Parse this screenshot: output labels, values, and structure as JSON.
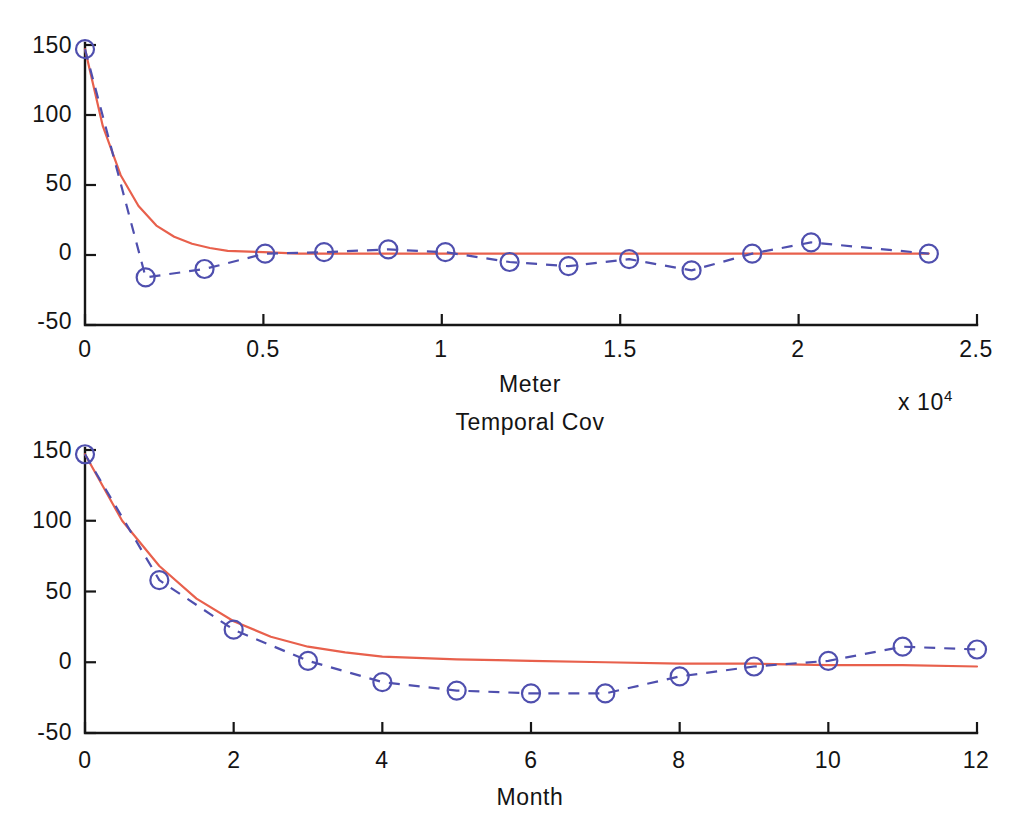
{
  "figure": {
    "background_color": "#ffffff",
    "model_color": "#e8604c",
    "empirical_color": "#4f4fae",
    "axis_color": "#161616"
  },
  "panels": {
    "spatial": {
      "x_axis_label": "Meter",
      "x_exponent_label": "x 10",
      "x_exponent_power": "4",
      "y_ticks": [
        "150",
        "100",
        "50",
        "0",
        "-50"
      ],
      "x_ticks": [
        "0",
        "0.5",
        "1",
        "1.5",
        "2",
        "2.5"
      ]
    },
    "temporal": {
      "title": "Temporal Cov",
      "x_axis_label": "Month",
      "y_ticks": [
        "150",
        "100",
        "50",
        "0",
        "-50"
      ],
      "x_ticks": [
        "0",
        "2",
        "4",
        "6",
        "8",
        "10",
        "12"
      ]
    }
  },
  "chart_data": [
    {
      "type": "line",
      "title": "",
      "xlabel": "Meter",
      "ylabel": "",
      "xlim": [
        0,
        25000
      ],
      "ylim": [
        -50,
        150
      ],
      "x_tick_values": [
        0,
        5000,
        10000,
        15000,
        20000,
        25000
      ],
      "x_tick_labels": [
        "0",
        "0.5",
        "1",
        "1.5",
        "2",
        "2.5"
      ],
      "x_tick_multiplier": "x 10^4",
      "y_tick_values": [
        -50,
        0,
        50,
        100,
        150
      ],
      "y_tick_labels": [
        "-50",
        "0",
        "50",
        "100",
        "150"
      ],
      "grid": false,
      "legend": "none",
      "series": [
        {
          "name": "Empirical spatial covariance",
          "style": "dashed-with-circle-markers",
          "color": "#4f4fae",
          "x": [
            0,
            1700,
            3350,
            5050,
            6700,
            8500,
            10100,
            11900,
            13550,
            15250,
            17000,
            18700,
            20350,
            23650
          ],
          "y": [
            147,
            -16,
            -10,
            1,
            2,
            4,
            2,
            -5,
            -8,
            -3,
            -11,
            1,
            9,
            1
          ]
        },
        {
          "name": "Fitted exponential model",
          "style": "solid",
          "color": "#e8604c",
          "x": [
            0,
            500,
            1000,
            1500,
            2000,
            2500,
            3000,
            3500,
            4000,
            5000,
            6000,
            8000,
            10000,
            14000,
            18000,
            23650
          ],
          "y": [
            147,
            92,
            57,
            35,
            21,
            13,
            8,
            5,
            3,
            2,
            1,
            1,
            1,
            1,
            1,
            1
          ]
        }
      ]
    },
    {
      "type": "line",
      "title": "Temporal Cov",
      "xlabel": "Month",
      "ylabel": "",
      "xlim": [
        0,
        12
      ],
      "ylim": [
        -50,
        150
      ],
      "x_tick_values": [
        0,
        2,
        4,
        6,
        8,
        10,
        12
      ],
      "x_tick_labels": [
        "0",
        "2",
        "4",
        "6",
        "8",
        "10",
        "12"
      ],
      "y_tick_values": [
        -50,
        0,
        50,
        100,
        150
      ],
      "y_tick_labels": [
        "-50",
        "0",
        "50",
        "100",
        "150"
      ],
      "grid": false,
      "legend": "none",
      "series": [
        {
          "name": "Empirical temporal covariance",
          "style": "dashed-with-circle-markers",
          "color": "#4f4fae",
          "x": [
            0,
            1,
            2,
            3,
            4,
            5,
            6,
            7,
            8,
            9,
            10,
            11,
            12
          ],
          "y": [
            147,
            58,
            23,
            1,
            -14,
            -20,
            -22,
            -22,
            -10,
            -3,
            1,
            11,
            9
          ]
        },
        {
          "name": "Fitted exponential model",
          "style": "solid",
          "color": "#e8604c",
          "x": [
            0,
            0.5,
            1,
            1.5,
            2,
            2.5,
            3,
            3.5,
            4,
            5,
            6,
            7,
            8,
            9,
            10,
            11,
            12
          ],
          "y": [
            147,
            100,
            68,
            45,
            29,
            18,
            11,
            7,
            4,
            2,
            1,
            0,
            -1,
            -1,
            -2,
            -2,
            -3
          ]
        }
      ]
    }
  ]
}
